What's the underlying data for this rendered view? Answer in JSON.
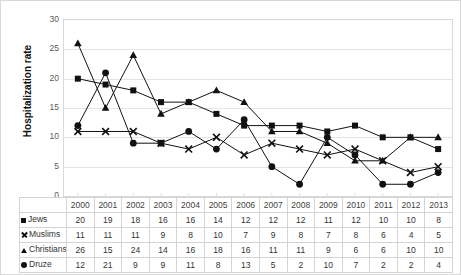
{
  "chart_data": {
    "type": "line",
    "title": "",
    "xlabel": "",
    "ylabel": "Hospitalization rate",
    "ylim": [
      0,
      30
    ],
    "yticks": [
      0,
      5,
      10,
      15,
      20,
      25,
      30
    ],
    "grid": true,
    "legend": "table",
    "categories": [
      "2000",
      "2001",
      "2002",
      "2003",
      "2004",
      "2005",
      "2006",
      "2007",
      "2008",
      "2009",
      "2010",
      "2011",
      "2012",
      "2013"
    ],
    "series": [
      {
        "name": "Jews",
        "marker": "square",
        "values": [
          20,
          19,
          18,
          16,
          16,
          14,
          12,
          12,
          12,
          11,
          12,
          10,
          10,
          8
        ]
      },
      {
        "name": "Muslims",
        "marker": "x",
        "values": [
          11,
          11,
          11,
          9,
          8,
          10,
          7,
          9,
          8,
          7,
          8,
          6,
          4,
          5
        ]
      },
      {
        "name": "Christians",
        "marker": "triangle",
        "values": [
          26,
          15,
          24,
          14,
          16,
          18,
          16,
          11,
          11,
          9,
          6,
          6,
          10,
          10
        ]
      },
      {
        "name": "Druze",
        "marker": "circle",
        "values": [
          12,
          21,
          9,
          9,
          11,
          8,
          13,
          5,
          2,
          10,
          7,
          2,
          2,
          4
        ]
      }
    ]
  },
  "colors": {
    "series": "#111111",
    "gridline": "#e4e4e4",
    "axis_text": "#595959",
    "table_border": "#d4d4d4",
    "frame": "#d9d9d9"
  },
  "table": {
    "corner_label": "",
    "row_labels": [
      "Jews",
      "Muslims",
      "Christians",
      "Druze"
    ]
  }
}
